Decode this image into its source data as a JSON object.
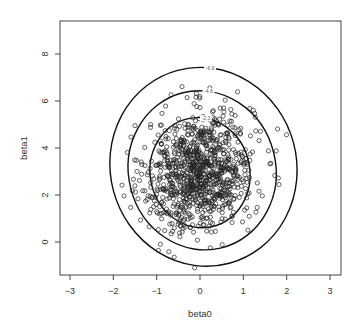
{
  "chart_data": {
    "type": "scatter",
    "title": "",
    "xlabel": "beta0",
    "ylabel": "beta1",
    "xlim": [
      -3.2,
      3.2
    ],
    "ylim": [
      -1.4,
      9.4
    ],
    "xticks": [
      -3,
      -2,
      -1,
      0,
      1,
      2,
      3
    ],
    "yticks": [
      0,
      2,
      4,
      6,
      8
    ],
    "grid": false,
    "legend": null,
    "points": {
      "description": "approximately 1000 posterior samples drawn as open circles, roughly bivariate normal",
      "count": 1000,
      "center": [
        0.0,
        3.0
      ],
      "sd": [
        0.62,
        1.25
      ],
      "correlation": 0.15,
      "marker": "open-circle"
    },
    "contours": [
      {
        "label": "-2.3",
        "center": [
          0.0,
          2.95
        ],
        "rx": 1.15,
        "ry": 2.35,
        "tilt_deg": -12
      },
      {
        "label": "-4.6",
        "center": [
          0.05,
          3.05
        ],
        "rx": 1.7,
        "ry": 3.4,
        "tilt_deg": -14
      },
      {
        "label": "-6.9",
        "center": [
          0.08,
          3.2
        ],
        "rx": 2.15,
        "ry": 4.25,
        "tilt_deg": -15
      }
    ]
  },
  "colors": {
    "axis": "#444444",
    "points": "#222222",
    "contours": "#111111",
    "background": "#ffffff"
  }
}
